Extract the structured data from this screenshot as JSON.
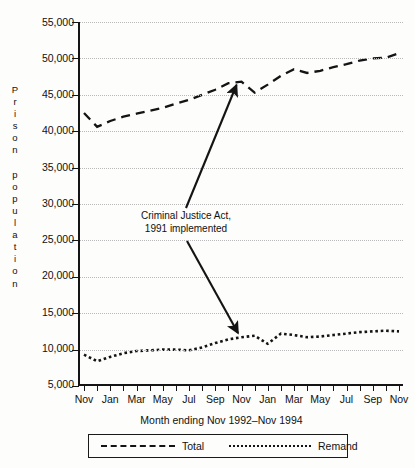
{
  "axes": {
    "ylabel_text": "Prison population",
    "ylabel_stacked": "P\nr\ni\ns\no\nn\n\np\no\np\nu\nl\na\nt\ni\no\nn",
    "xlabel": "Month ending Nov 1992–Nov 1994",
    "ytick_labels": [
      "55,000",
      "50,000",
      "45,000",
      "40,000",
      "35,000",
      "30,000",
      "25,000",
      "20,000",
      "15,000",
      "10,000",
      "5,000"
    ],
    "xtick_labels": [
      "Nov",
      "Jan",
      "Mar",
      "May",
      "Jul",
      "Sep",
      "Nov",
      "Jan",
      "Mar",
      "May",
      "Jul",
      "Sep",
      "Nov"
    ]
  },
  "annotation": {
    "line1": "Criminal Justice Act,",
    "line2": "1991 implemented"
  },
  "legend": {
    "total_label": "Total",
    "remand_label": "Remand"
  },
  "colors": {
    "ink": "#141414",
    "grid": "#b9b9b9",
    "paper": "#fdfdfb"
  },
  "chart_data": {
    "type": "line",
    "title": "",
    "subtitle": "",
    "xlabel": "Month ending Nov 1992–Nov 1994",
    "ylabel": "Prison population",
    "ylim": [
      5000,
      55000
    ],
    "ytick_values": [
      5000,
      10000,
      15000,
      20000,
      25000,
      30000,
      35000,
      40000,
      45000,
      50000,
      55000
    ],
    "grid": true,
    "grid_style": "dotted-horizontal",
    "legend_position": "below-axis",
    "annotations": [
      {
        "text": "Criminal Justice Act, 1991 implemented",
        "points_to": [
          "Total series near Oct 1993",
          "Remand series near Oct 1993"
        ],
        "arrows": 2
      }
    ],
    "x": [
      "Nov 1992",
      "Dec 1992",
      "Jan 1993",
      "Feb 1993",
      "Mar 1993",
      "Apr 1993",
      "May 1993",
      "Jun 1993",
      "Jul 1993",
      "Aug 1993",
      "Sep 1993",
      "Oct 1993",
      "Nov 1993",
      "Dec 1993",
      "Jan 1994",
      "Feb 1994",
      "Mar 1994",
      "Apr 1994",
      "May 1994",
      "Jun 1994",
      "Jul 1994",
      "Aug 1994",
      "Sep 1994",
      "Oct 1994",
      "Nov 1994"
    ],
    "series": [
      {
        "name": "Total",
        "style": "dashed",
        "values": [
          42500,
          40600,
          41400,
          42000,
          42400,
          42800,
          43200,
          43800,
          44300,
          45000,
          45700,
          46600,
          46800,
          45300,
          46400,
          47600,
          48500,
          48000,
          48300,
          48800,
          49200,
          49700,
          50000,
          50100,
          50700
        ]
      },
      {
        "name": "Remand",
        "style": "dotted",
        "values": [
          9300,
          8400,
          9000,
          9500,
          9800,
          9900,
          10000,
          10000,
          9900,
          10300,
          10900,
          11400,
          11700,
          11900,
          10800,
          12200,
          12000,
          11700,
          11800,
          12000,
          12200,
          12400,
          12500,
          12600,
          12500
        ]
      }
    ]
  }
}
